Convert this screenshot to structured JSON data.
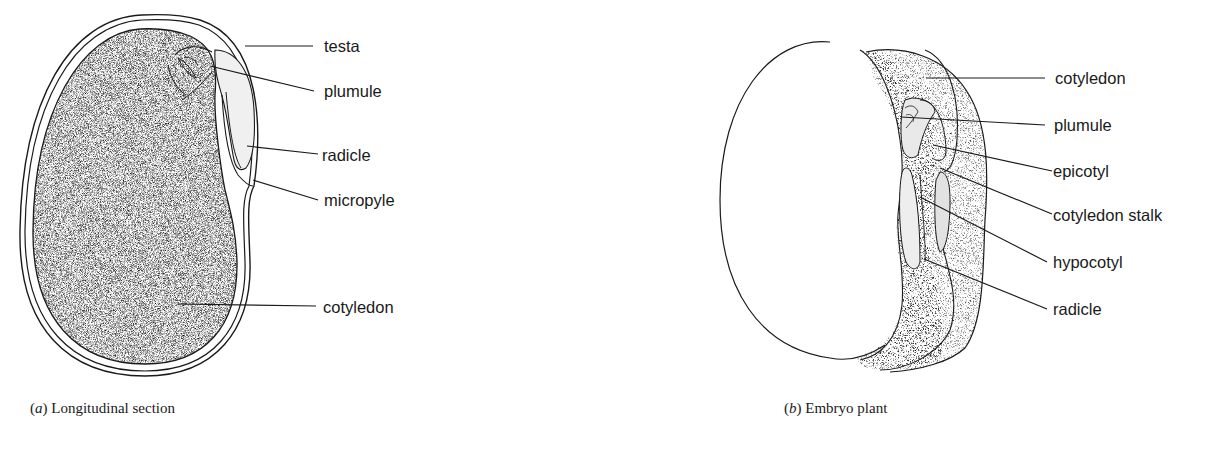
{
  "figure_a": {
    "caption_letter": "a",
    "caption_text": "Longitudinal section",
    "labels": {
      "testa": "testa",
      "plumule": "plumule",
      "radicle": "radicle",
      "micropyle": "micropyle",
      "cotyledon": "cotyledon"
    }
  },
  "figure_b": {
    "caption_letter": "b",
    "caption_text": "Embryo plant",
    "labels": {
      "cotyledon": "cotyledon",
      "plumule": "plumule",
      "epicotyl": "epicotyl",
      "cotyledon_stalk": "cotyledon stalk",
      "hypocotyl": "hypocotyl",
      "radicle": "radicle"
    }
  }
}
